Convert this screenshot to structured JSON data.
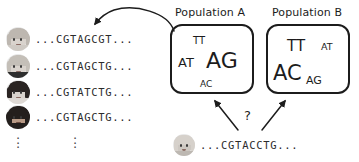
{
  "figure": {
    "title_text": "",
    "colors": {
      "ink": "#1c1c1c",
      "sequence_text": "#2b2b2b",
      "background": "#ffffff"
    }
  },
  "individuals": [
    {
      "avatar_name": "avatar-person-1",
      "hair": "light-short",
      "sequence": "...CGTAGCGT..."
    },
    {
      "avatar_name": "avatar-person-2",
      "hair": "light-short",
      "sequence": "...CGTAGCTG..."
    },
    {
      "avatar_name": "avatar-person-3",
      "hair": "dark-pigtails",
      "sequence": "...CGTATCTG..."
    },
    {
      "avatar_name": "avatar-person-4",
      "hair": "dark-long",
      "sequence": "...CGTAGCTG..."
    }
  ],
  "ellipsis": {
    "avatar_column": "⋮",
    "sequence_column": "⋮"
  },
  "populations": [
    {
      "label": "Population A",
      "alleles": [
        {
          "text": "TT",
          "size": "small"
        },
        {
          "text": "AT",
          "size": "medium"
        },
        {
          "text": "AG",
          "size": "large"
        },
        {
          "text": "AC",
          "size": "xsmall"
        }
      ]
    },
    {
      "label": "Population B",
      "alleles": [
        {
          "text": "TT",
          "size": "medium"
        },
        {
          "text": "AT",
          "size": "xsmall"
        },
        {
          "text": "AC",
          "size": "large"
        },
        {
          "text": "AG",
          "size": "small"
        }
      ]
    }
  ],
  "unknown_individual": {
    "avatar_name": "avatar-unknown-person",
    "sequence": "...CGTACCTG..."
  },
  "annotations": {
    "question_mark": "?",
    "sampling_arrow_name": "curved-sampling-arrow",
    "assignment_arrow_left_name": "assignment-arrow-to-population-a",
    "assignment_arrow_right_name": "assignment-arrow-to-population-b"
  }
}
